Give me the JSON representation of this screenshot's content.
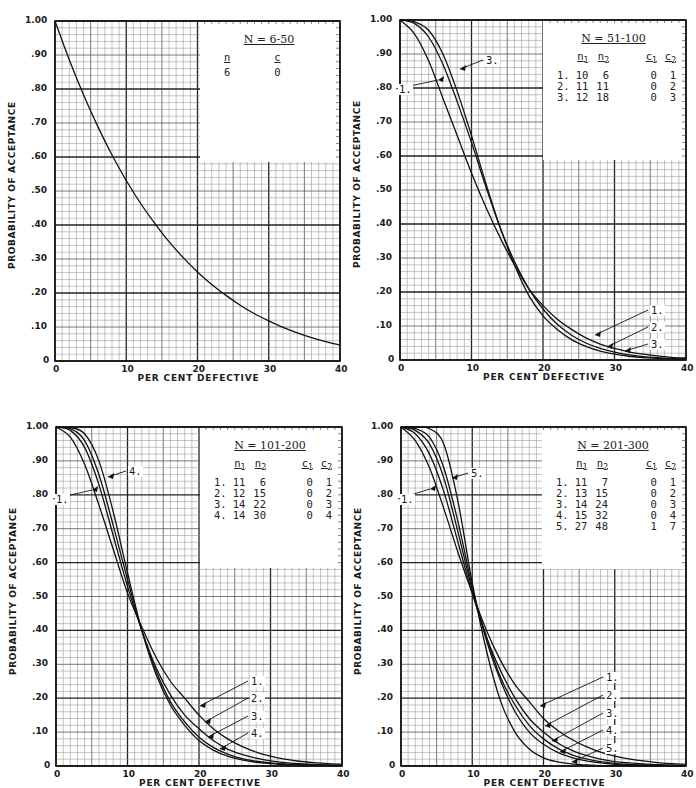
{
  "common": {
    "ylabel": "PROBABILITY OF ACCEPTANCE",
    "xlabel": "PER CENT DEFECTIVE",
    "y_ticks": [
      "0",
      ".10",
      ".20",
      ".30",
      ".40",
      ".50",
      ".60",
      ".70",
      ".80",
      ".90",
      "1.00"
    ],
    "x_ticks": [
      "0",
      "10",
      "20",
      "30",
      "40"
    ]
  },
  "chart_data": [
    {
      "type": "line",
      "title": "N = 6-50",
      "xlabel": "PER CENT DEFECTIVE",
      "ylabel": "PROBABILITY OF ACCEPTANCE",
      "xlim": [
        0,
        40
      ],
      "ylim": [
        0,
        1.0
      ],
      "grid": true,
      "legend_position": "upper right (table box)",
      "legend_table": {
        "headers": [
          "n",
          "c"
        ],
        "rows": [
          [
            "6",
            "0"
          ]
        ]
      },
      "x": [
        0,
        2,
        4,
        6,
        8,
        10,
        12,
        14,
        16,
        18,
        20,
        22,
        24,
        26,
        28,
        30,
        32,
        34,
        36,
        38,
        40
      ],
      "series": [
        {
          "name": "n=6, c=0",
          "values": [
            1.0,
            0.886,
            0.783,
            0.69,
            0.606,
            0.531,
            0.464,
            0.405,
            0.351,
            0.304,
            0.262,
            0.225,
            0.193,
            0.164,
            0.139,
            0.118,
            0.099,
            0.083,
            0.069,
            0.057,
            0.047
          ]
        }
      ]
    },
    {
      "type": "line",
      "title": "N = 51-100",
      "xlabel": "PER CENT DEFECTIVE",
      "ylabel": "PROBABILITY OF ACCEPTANCE",
      "xlim": [
        0,
        40
      ],
      "ylim": [
        0,
        1.0
      ],
      "grid": true,
      "legend_position": "upper right (table box)",
      "legend_table": {
        "headers": [
          "",
          "n1",
          "n2",
          "c1",
          "c2"
        ],
        "rows": [
          [
            "1.",
            "10",
            "6",
            "0",
            "1"
          ],
          [
            "2.",
            "11",
            "11",
            "0",
            "2"
          ],
          [
            "3.",
            "12",
            "18",
            "0",
            "3"
          ]
        ]
      },
      "curve_labels": [
        "1.",
        "3.",
        "1.",
        "2.",
        "3."
      ],
      "x": [
        0,
        2,
        4,
        6,
        8,
        10,
        12,
        14,
        16,
        18,
        20,
        22,
        24,
        26,
        28,
        30,
        32,
        34,
        36,
        38,
        40
      ],
      "series": [
        {
          "name": "1.",
          "values": [
            1.0,
            0.96,
            0.88,
            0.77,
            0.66,
            0.55,
            0.45,
            0.36,
            0.28,
            0.21,
            0.16,
            0.12,
            0.09,
            0.065,
            0.047,
            0.034,
            0.024,
            0.017,
            0.012,
            0.008,
            0.006
          ]
        },
        {
          "name": "2.",
          "values": [
            1.0,
            0.99,
            0.95,
            0.87,
            0.76,
            0.64,
            0.51,
            0.39,
            0.29,
            0.21,
            0.15,
            0.105,
            0.073,
            0.05,
            0.034,
            0.023,
            0.015,
            0.01,
            0.007,
            0.005,
            0.003
          ]
        },
        {
          "name": "3.",
          "values": [
            1.0,
            0.995,
            0.97,
            0.9,
            0.79,
            0.66,
            0.52,
            0.39,
            0.28,
            0.19,
            0.13,
            0.09,
            0.06,
            0.04,
            0.026,
            0.017,
            0.011,
            0.007,
            0.005,
            0.003,
            0.002
          ]
        }
      ]
    },
    {
      "type": "line",
      "title": "N = 101-200",
      "xlabel": "PER CENT DEFECTIVE",
      "ylabel": "PROBABILITY OF ACCEPTANCE",
      "xlim": [
        0,
        40
      ],
      "ylim": [
        0,
        1.0
      ],
      "grid": true,
      "legend_position": "upper right (table box)",
      "legend_table": {
        "headers": [
          "",
          "n1",
          "n2",
          "c1",
          "c2"
        ],
        "rows": [
          [
            "1.",
            "11",
            "6",
            "0",
            "1"
          ],
          [
            "2.",
            "12",
            "15",
            "0",
            "2"
          ],
          [
            "3.",
            "14",
            "22",
            "0",
            "3"
          ],
          [
            "4.",
            "14",
            "30",
            "0",
            "4"
          ]
        ]
      },
      "curve_labels": [
        "1.",
        "4.",
        "1.",
        "2.",
        "3.",
        "4."
      ],
      "x": [
        0,
        2,
        4,
        6,
        8,
        10,
        12,
        14,
        16,
        18,
        20,
        22,
        24,
        26,
        28,
        30,
        32,
        34,
        36,
        38,
        40
      ],
      "series": [
        {
          "name": "1.",
          "values": [
            1.0,
            0.97,
            0.89,
            0.77,
            0.64,
            0.51,
            0.41,
            0.32,
            0.25,
            0.2,
            0.15,
            0.11,
            0.08,
            0.058,
            0.041,
            0.029,
            0.02,
            0.014,
            0.01,
            0.007,
            0.005
          ]
        },
        {
          "name": "2.",
          "values": [
            1.0,
            0.99,
            0.94,
            0.83,
            0.68,
            0.53,
            0.4,
            0.29,
            0.21,
            0.15,
            0.11,
            0.075,
            0.05,
            0.034,
            0.023,
            0.015,
            0.01,
            0.007,
            0.005,
            0.003,
            0.002
          ]
        },
        {
          "name": "3.",
          "values": [
            1.0,
            0.995,
            0.96,
            0.86,
            0.71,
            0.55,
            0.4,
            0.28,
            0.19,
            0.13,
            0.085,
            0.055,
            0.035,
            0.022,
            0.014,
            0.009,
            0.006,
            0.004,
            0.003,
            0.002,
            0.001
          ]
        },
        {
          "name": "4.",
          "values": [
            1.0,
            0.998,
            0.98,
            0.9,
            0.75,
            0.57,
            0.4,
            0.27,
            0.18,
            0.12,
            0.075,
            0.047,
            0.029,
            0.018,
            0.011,
            0.007,
            0.004,
            0.003,
            0.002,
            0.001,
            0.001
          ]
        }
      ]
    },
    {
      "type": "line",
      "title": "N = 201-300",
      "xlabel": "PER CENT DEFECTIVE",
      "ylabel": "PROBABILITY OF ACCEPTANCE",
      "xlim": [
        0,
        40
      ],
      "ylim": [
        0,
        1.0
      ],
      "grid": true,
      "legend_position": "upper right (table box)",
      "legend_table": {
        "headers": [
          "",
          "n1",
          "n2",
          "c1",
          "c2"
        ],
        "rows": [
          [
            "1.",
            "11",
            "7",
            "0",
            "1"
          ],
          [
            "2.",
            "13",
            "15",
            "0",
            "2"
          ],
          [
            "3.",
            "14",
            "24",
            "0",
            "3"
          ],
          [
            "4.",
            "15",
            "32",
            "0",
            "4"
          ],
          [
            "5.",
            "27",
            "48",
            "1",
            "7"
          ]
        ]
      },
      "curve_labels": [
        "1.",
        "5.",
        "1.",
        "2.",
        "3.",
        "4.",
        "5."
      ],
      "x": [
        0,
        2,
        4,
        6,
        8,
        10,
        12,
        14,
        16,
        18,
        20,
        22,
        24,
        26,
        28,
        30,
        32,
        34,
        36,
        38,
        40
      ],
      "series": [
        {
          "name": "1.",
          "values": [
            1.0,
            0.96,
            0.88,
            0.76,
            0.63,
            0.51,
            0.4,
            0.31,
            0.24,
            0.19,
            0.14,
            0.105,
            0.078,
            0.057,
            0.041,
            0.029,
            0.021,
            0.015,
            0.01,
            0.007,
            0.005
          ]
        },
        {
          "name": "2.",
          "values": [
            1.0,
            0.98,
            0.92,
            0.81,
            0.66,
            0.51,
            0.38,
            0.28,
            0.2,
            0.14,
            0.1,
            0.068,
            0.046,
            0.031,
            0.02,
            0.013,
            0.009,
            0.006,
            0.004,
            0.003,
            0.002
          ]
        },
        {
          "name": "3.",
          "values": [
            1.0,
            0.99,
            0.95,
            0.85,
            0.69,
            0.52,
            0.38,
            0.26,
            0.18,
            0.12,
            0.08,
            0.052,
            0.033,
            0.021,
            0.013,
            0.008,
            0.005,
            0.003,
            0.002,
            0.001,
            0.001
          ]
        },
        {
          "name": "4.",
          "values": [
            1.0,
            0.995,
            0.97,
            0.88,
            0.72,
            0.53,
            0.37,
            0.25,
            0.16,
            0.1,
            0.064,
            0.04,
            0.025,
            0.015,
            0.009,
            0.005,
            0.003,
            0.002,
            0.001,
            0.001,
            0.0
          ]
        },
        {
          "name": "5.",
          "values": [
            1.0,
            1.0,
            0.995,
            0.95,
            0.78,
            0.54,
            0.34,
            0.19,
            0.1,
            0.05,
            0.024,
            0.012,
            0.006,
            0.003,
            0.001,
            0.001,
            0.0,
            0.0,
            0.0,
            0.0,
            0.0
          ]
        }
      ]
    }
  ]
}
